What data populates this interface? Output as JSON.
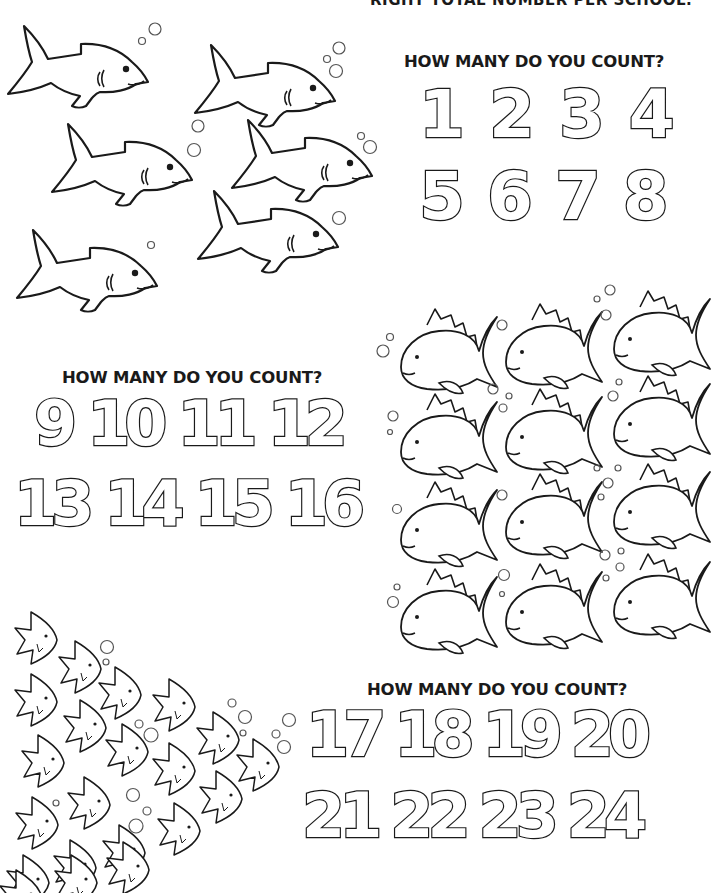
{
  "header": {
    "instruction_tail": "RIGHT TOTAL NUMBER PER SCHOOL."
  },
  "sections": [
    {
      "name": "sharks",
      "question": "HOW MANY DO YOU COUNT?",
      "options_row1": [
        "1",
        "2",
        "3",
        "4"
      ],
      "options_row2": [
        "5",
        "6",
        "7",
        "8"
      ],
      "fish_type": "shark",
      "fish_count": 6
    },
    {
      "name": "goldfish",
      "question": "HOW MANY DO YOU COUNT?",
      "options_row1": [
        "9",
        "10",
        "11",
        "12"
      ],
      "options_row2": [
        "13",
        "14",
        "15",
        "16"
      ],
      "fish_type": "goldfish",
      "fish_count": 12
    },
    {
      "name": "angelfish",
      "question": "HOW MANY DO YOU COUNT?",
      "options_row1": [
        "17",
        "18",
        "19",
        "20"
      ],
      "options_row2": [
        "21",
        "22",
        "23",
        "24"
      ],
      "fish_type": "angelfish",
      "fish_count": 21
    }
  ],
  "colors": {
    "ink": "#1a1a1a",
    "paper": "#ffffff",
    "bubble": "#555555"
  }
}
